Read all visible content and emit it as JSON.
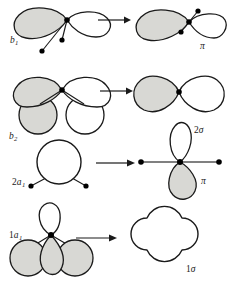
{
  "figure": {
    "type": "orbital-correlation-diagram",
    "background_color": "#ffffff",
    "stroke_color": "#1a1a1a",
    "shaded_fill": "#d8d8d4",
    "unshaded_fill": "#ffffff",
    "dot_color": "#000000",
    "rows": [
      {
        "id": "row-b1",
        "left_label": {
          "prefix": "",
          "letter": "b",
          "sub": "1"
        },
        "right_label": {
          "prefix": "",
          "letter": "π",
          "sub": ""
        },
        "arrow": "right-arrow"
      },
      {
        "id": "row-b2",
        "left_label": {
          "prefix": "",
          "letter": "b",
          "sub": "2"
        },
        "right_label": {
          "prefix": "2",
          "letter": "σ",
          "sub": ""
        },
        "arrow": "right-arrow"
      },
      {
        "id": "row-2a1",
        "left_label": {
          "prefix": "2",
          "letter": "a",
          "sub": "1"
        },
        "right_label": {
          "prefix": "",
          "letter": "π",
          "sub": ""
        },
        "arrow": "right-arrow"
      },
      {
        "id": "row-1a1",
        "left_label": {
          "prefix": "1",
          "letter": "a",
          "sub": "1"
        },
        "right_label": {
          "prefix": "1",
          "letter": "σ",
          "sub": ""
        },
        "arrow": "right-arrow"
      }
    ],
    "labels": {
      "b1_prefix": "",
      "b1_letter": "b",
      "b1_sub": "1",
      "pi_top": "π",
      "b2_prefix": "",
      "b2_letter": "b",
      "b2_sub": "2",
      "two_sigma_num": "2",
      "two_sigma_letter": "σ",
      "a1_two_prefix": "2",
      "a1_two_letter": "a",
      "a1_two_sub": "1",
      "pi_mid": "π",
      "a1_one_prefix": "1",
      "a1_one_letter": "a",
      "a1_one_sub": "1",
      "one_sigma_num": "1",
      "one_sigma_letter": "σ"
    }
  }
}
